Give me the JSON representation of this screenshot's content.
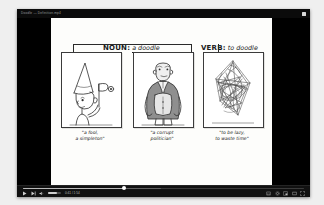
{
  "window": {
    "title": "Doodle — Definition.mp4",
    "restore_icon": "restore-window-icon"
  },
  "video": {
    "headings": [
      {
        "id": "noun",
        "pos": "NOUN:",
        "word": "a doodle"
      },
      {
        "id": "verb",
        "pos": "VERB:",
        "word": "to doodle"
      }
    ],
    "panels": [
      {
        "id": "panel-1",
        "illustration": "fool-with-dunce-cap-and-flag"
      },
      {
        "id": "panel-2",
        "illustration": "stout-politician-in-suit"
      },
      {
        "id": "panel-3",
        "illustration": "tangled-scribble-doodle"
      }
    ],
    "captions": [
      {
        "line1": "\"a fool,",
        "line2": "a simpleton\""
      },
      {
        "line1": "\"a corrupt",
        "line2": "politician\""
      },
      {
        "line1": "\"to be lazy,",
        "line2": "to waste time\""
      }
    ]
  },
  "controls": {
    "play_label": "play-icon",
    "next_label": "next-track-icon",
    "volume_label": "volume-icon",
    "timecode": "0:41 / 1:54",
    "subtitles_label": "subtitles-icon",
    "settings_label": "settings-gear-icon",
    "pip_label": "picture-in-picture-icon",
    "theater_label": "theater-mode-icon",
    "fullscreen_label": "fullscreen-icon",
    "progress_percent": 36
  },
  "colors": {
    "window_chrome": "#000000",
    "paper": "#fdfdfb",
    "ink": "#1a1a1a",
    "scrubber_fill": "#b9b9b9"
  }
}
